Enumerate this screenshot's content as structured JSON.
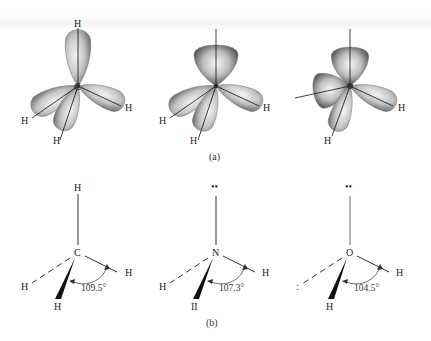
{
  "figure": {
    "panel_a": {
      "caption": "(a)",
      "molecules": [
        {
          "name": "methane-orbitals",
          "center": "C",
          "labels": [
            "H",
            "H",
            "H",
            "H"
          ],
          "description": "sp3 hybrid lobes, four bonding lobes each to H"
        },
        {
          "name": "ammonia-orbitals",
          "center": "",
          "labels": [
            "H",
            "H",
            "H"
          ],
          "description": "one lone-pair lobe up, three bonding lobes to H"
        },
        {
          "name": "water-orbitals",
          "center": "O",
          "labels": [
            "H",
            "H"
          ],
          "description": "two lone-pair lobes, two bonding lobes to H"
        }
      ]
    },
    "panel_b": {
      "caption": "(b)",
      "molecules": [
        {
          "name": "methane-structure",
          "center": "C",
          "top": "H",
          "left": "H",
          "right": "H",
          "bottom": "H",
          "angle": "109.5°"
        },
        {
          "name": "ammonia-structure",
          "center": "N",
          "top": "••",
          "left": "H",
          "right": "H",
          "bottom": "II",
          "angle": "107.3°"
        },
        {
          "name": "water-structure",
          "center": "O",
          "top": "••",
          "left": ":",
          "right": "H",
          "bottom": "H",
          "angle": "104.5°"
        }
      ]
    }
  },
  "colors": {
    "lobe_light": "#f2f2f2",
    "lobe_mid": "#b5b5b5",
    "lobe_dark": "#5a5a5a",
    "ink": "#222222"
  }
}
